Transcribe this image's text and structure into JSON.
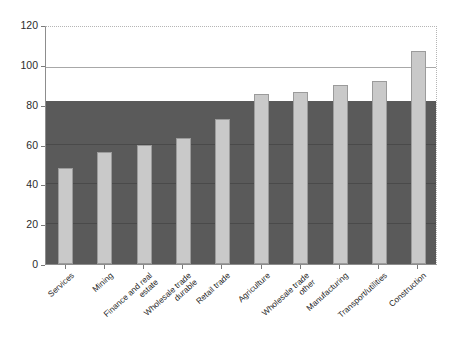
{
  "chart_data": {
    "type": "bar",
    "title": "",
    "subtitle": "",
    "xlabel": "",
    "ylabel": "",
    "categories": [
      "Services",
      "Mining",
      "Finance and real\nestate",
      "Wholesale trade\ndurable",
      "Retail trade",
      "Agriculture",
      "Wholesale trade\nother",
      "Manufacturing",
      "Transport/utilities",
      "Construction"
    ],
    "values": [
      48,
      56,
      60,
      63.5,
      73,
      85.5,
      86.5,
      90,
      92,
      107
    ],
    "ylim": [
      0,
      120
    ],
    "yticks": [
      0,
      20,
      40,
      60,
      80,
      100,
      120
    ],
    "ytick_labels": [
      "0",
      "20",
      "40",
      "60",
      "80",
      "100",
      "120"
    ],
    "grid": true,
    "legend": "none",
    "annotations": {
      "shaded_band": {
        "from": 0,
        "to": 82,
        "color": "#5a5a5a",
        "description": "dark shaded region behind bars"
      },
      "reference_line": {
        "value": 100,
        "color": "#a8a8a8"
      }
    },
    "colors": {
      "bar_fill": "#c9c9c9",
      "bar_edge": "#9b9b9b",
      "band": "#5a5a5a",
      "band_gridline": "#4a4a4a",
      "axis": "#8d8d8d",
      "plot_border_dotted": "#b5b5b5",
      "text": "#1f1f1f",
      "background": "#ffffff"
    }
  },
  "caption": {
    "text": ""
  }
}
